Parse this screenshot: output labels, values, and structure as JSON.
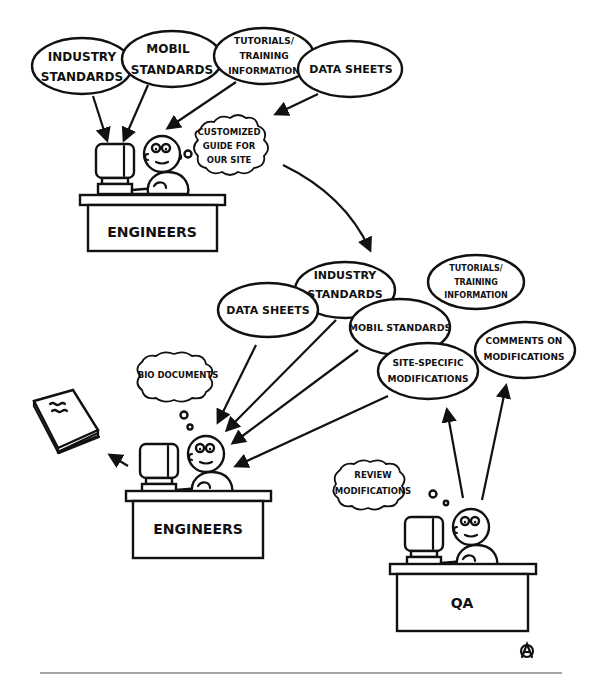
{
  "diagram": {
    "top_section": {
      "sources": [
        {
          "id": "industry-standards",
          "lines": [
            "INDUSTRY",
            "STANDARDS"
          ]
        },
        {
          "id": "mobil-standards",
          "lines": [
            "MOBIL",
            "STANDARDS"
          ]
        },
        {
          "id": "tutorials-training",
          "lines": [
            "TUTORIALS/",
            "TRAINING",
            "INFORMATION"
          ]
        },
        {
          "id": "data-sheets",
          "lines": [
            "DATA SHEETS"
          ]
        }
      ],
      "thought": {
        "lines": [
          "CUSTOMIZED",
          "GUIDE FOR",
          "OUR SITE"
        ]
      },
      "desk_label": "ENGINEERS"
    },
    "middle_section": {
      "guide_components": [
        {
          "id": "data-sheets",
          "lines": [
            "DATA SHEETS"
          ]
        },
        {
          "id": "industry-standards",
          "lines": [
            "INDUSTRY",
            "STANDARDS"
          ]
        },
        {
          "id": "mobil-standards",
          "lines": [
            "MOBIL  STANDARDS"
          ]
        },
        {
          "id": "site-specific-modifications",
          "lines": [
            "SITE-SPECIFIC",
            "MODIFICATIONS"
          ]
        },
        {
          "id": "tutorials-training",
          "lines": [
            "TUTORIALS/",
            "TRAINING",
            "INFORMATION"
          ]
        },
        {
          "id": "comments-on-modifications",
          "lines": [
            "COMMENTS ON",
            "MODIFICATIONS"
          ]
        }
      ]
    },
    "bottom_left": {
      "thought": {
        "lines": [
          "BIO DOCUMENTS"
        ]
      },
      "desk_label": "ENGINEERS",
      "output": "book"
    },
    "bottom_right": {
      "thought": {
        "lines": [
          "REVIEW",
          "MODIFICATIONS"
        ]
      },
      "desk_label": "QA"
    },
    "signature": "artist-monogram"
  },
  "colors": {
    "ink": "#111111",
    "paper": "#ffffff",
    "rule": "#888888"
  }
}
